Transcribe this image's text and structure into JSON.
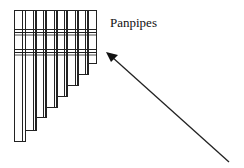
{
  "diagram": {
    "label": "Panpipes",
    "pipe_count": 8,
    "arrow": {
      "direction": "pointing up-left toward panpipes"
    },
    "colors": {
      "stroke": "#222222",
      "background": "#ffffff"
    }
  }
}
